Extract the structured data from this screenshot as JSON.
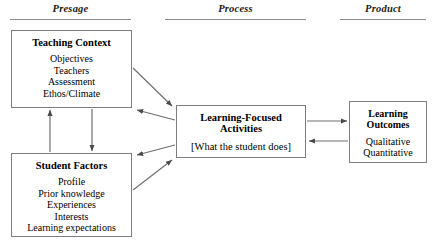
{
  "diagram": {
    "phases": [
      {
        "id": "presage",
        "label": "Presage"
      },
      {
        "id": "process",
        "label": "Process"
      },
      {
        "id": "product",
        "label": "Product"
      }
    ],
    "nodes": {
      "teaching_context": {
        "title": "Teaching Context",
        "items": [
          "Objectives",
          "Teachers",
          "Assessment",
          "Ethos/Climate"
        ]
      },
      "student_factors": {
        "title": "Student Factors",
        "items": [
          "Profile",
          "Prior knowledge",
          "Experiences",
          "Interests",
          "Learning expectations"
        ]
      },
      "learning_activities": {
        "title_line1": "Learning-Focused",
        "title_line2": "Activities",
        "items": [
          "[What the student does]"
        ]
      },
      "learning_outcomes": {
        "title_line1": "Learning",
        "title_line2": "Outcomes",
        "items": [
          "Qualitative",
          "Quantitative"
        ]
      }
    },
    "colors": {
      "box_border": "#7d7d7d",
      "rule": "#8a8a8a",
      "arrow": "#6f6f6f",
      "text": "#000000",
      "background": "#ffffff"
    },
    "connections": [
      {
        "from": "student_factors",
        "to": "teaching_context",
        "direction": "up"
      },
      {
        "from": "teaching_context",
        "to": "student_factors",
        "direction": "down"
      },
      {
        "from": "teaching_context",
        "to": "learning_activities",
        "direction": "right"
      },
      {
        "from": "learning_activities",
        "to": "teaching_context",
        "direction": "left"
      },
      {
        "from": "student_factors",
        "to": "learning_activities",
        "direction": "right"
      },
      {
        "from": "learning_activities",
        "to": "student_factors",
        "direction": "left"
      },
      {
        "from": "learning_activities",
        "to": "learning_outcomes",
        "direction": "right"
      },
      {
        "from": "learning_outcomes",
        "to": "learning_activities",
        "direction": "left"
      }
    ]
  }
}
